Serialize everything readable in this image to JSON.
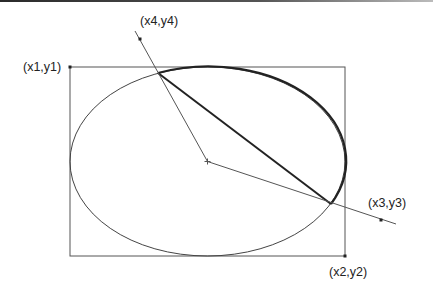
{
  "diagram": {
    "labels": {
      "p1": "(x1,y1)",
      "p2": "(x2,y2)",
      "p3": "(x3,y3)",
      "p4": "(x4,y4)"
    },
    "colors": {
      "stroke": "#333333",
      "bold_stroke": "#222222",
      "background": "#ffffff"
    },
    "geometry": {
      "rect": {
        "x1": 70,
        "y1": 67,
        "x2": 345,
        "y2": 256
      },
      "ellipse_center": [
        207.5,
        161.5
      ],
      "ellipse_radii": [
        137.5,
        94.5
      ],
      "point3": [
        381,
        220
      ],
      "point4": [
        140,
        39
      ],
      "arc_start": [
        158,
        73
      ],
      "arc_end": [
        331,
        204
      ]
    }
  }
}
